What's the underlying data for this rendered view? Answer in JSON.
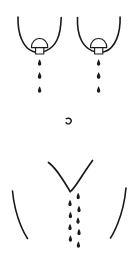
{
  "figure": {
    "title": "Anatomical torso line drawing with fluid droplets",
    "canvas": {
      "width": 138,
      "height": 258
    },
    "colors": {
      "background": "#ffffff",
      "ink": "#1a1a1a"
    },
    "stroke": {
      "body_outline_width": 1.6,
      "areola_width": 1.1,
      "nipple_width": 1.1,
      "hip_width": 1.6,
      "groin_width": 1.7
    },
    "parts": [
      {
        "name": "left-breast-outline",
        "label": "Left breast underline curve",
        "path": "M 18 17 C 17.5 34 23 48 33 51.5 C 42 54.5 52 50 57 40 C 59.5 34.8 61 26 61.2 17.5"
      },
      {
        "name": "right-breast-outline",
        "label": "Right breast underline curve",
        "path": "M 77.5 17.5 C 77.2 26 78.7 34.8 81.2 40 C 86.2 50 96 54.5 105 51.5 C 115 48 120.6 34 120.1 17"
      },
      {
        "name": "left-areola",
        "label": "Left areola dome",
        "path": "M 31.4 47.6 C 31.4 41.6 35.4 38.5 39.6 38.5 C 43.8 38.5 47.8 41.6 47.8 47.6 Z"
      },
      {
        "name": "right-areola",
        "label": "Right areola dome",
        "path": "M 90.4 47.6 C 90.4 41.6 94.4 38.5 98.6 38.5 C 102.8 38.5 106.8 41.6 106.8 47.6 Z"
      },
      {
        "name": "left-nipple",
        "label": "Left nipple rectangle",
        "rect": {
          "x": 35.6,
          "y": 47.6,
          "width": 8.2,
          "height": 6.4
        }
      },
      {
        "name": "right-nipple",
        "label": "Right nipple rectangle",
        "rect": {
          "x": 94.6,
          "y": 47.6,
          "width": 8.2,
          "height": 6.4
        }
      },
      {
        "name": "navel-mark",
        "label": "Navel curl mark",
        "path": "M 66.3 118.6 C 70.4 117.4 72.4 120.2 70.6 122.6 C 69.2 124.4 66.9 124.2 66.1 122.6"
      },
      {
        "name": "groin-left-line",
        "label": "Left inguinal groin line",
        "path": "M 48.5 162.5 C 52.5 165.5 57 171 61 177 C 65 183 68.3 188.3 70.2 191.6"
      },
      {
        "name": "groin-right-line",
        "label": "Right inguinal groin line",
        "path": "M 92.5 160.5 C 89 165.5 84.5 172 80 179 C 75.5 186 71.8 190.6 70.2 191.6"
      },
      {
        "name": "left-hip-curve",
        "label": "Left hip and thigh curve",
        "path": "M 12.5 191 C 13.5 202 16.5 215 21 226 C 23.5 232 25.8 236 27.5 238.5"
      },
      {
        "name": "right-hip-curve",
        "label": "Right hip and thigh curve",
        "path": "M 126 188 C 125 199 122 213 117.5 224 C 114.8 230.5 112.4 235.2 110.5 238"
      }
    ],
    "droplets": {
      "shape_note": "teardrop: rounded bottom with tapered top point",
      "left_breast_stream": {
        "name": "left-nipple-droplet-stream",
        "count": 3,
        "points": [
          {
            "x": 39.6,
            "y": 63,
            "size": 1.0
          },
          {
            "x": 39.6,
            "y": 76,
            "size": 1.05
          },
          {
            "x": 39.6,
            "y": 90,
            "size": 1.0
          }
        ]
      },
      "right_breast_stream": {
        "name": "right-nipple-droplet-stream",
        "count": 3,
        "points": [
          {
            "x": 98.6,
            "y": 63,
            "size": 1.0
          },
          {
            "x": 98.6,
            "y": 76,
            "size": 1.05
          },
          {
            "x": 98.6,
            "y": 90,
            "size": 1.0
          }
        ]
      },
      "groin_right_stream": {
        "name": "groin-right-droplet-stream",
        "count": 5,
        "points": [
          {
            "x": 78.2,
            "y": 196.5,
            "size": 1.0
          },
          {
            "x": 79.0,
            "y": 209.5,
            "size": 1.0
          },
          {
            "x": 78.0,
            "y": 221.0,
            "size": 1.0
          },
          {
            "x": 79.0,
            "y": 232.5,
            "size": 1.0
          },
          {
            "x": 78.4,
            "y": 245.0,
            "size": 1.0
          }
        ]
      },
      "groin_left_stream": {
        "name": "groin-left-droplet-stream",
        "count": 4,
        "points": [
          {
            "x": 70.0,
            "y": 203.5,
            "size": 1.0
          },
          {
            "x": 70.4,
            "y": 215.5,
            "size": 1.0
          },
          {
            "x": 70.0,
            "y": 227.5,
            "size": 1.0
          },
          {
            "x": 70.4,
            "y": 239.0,
            "size": 1.0
          }
        ]
      }
    }
  }
}
